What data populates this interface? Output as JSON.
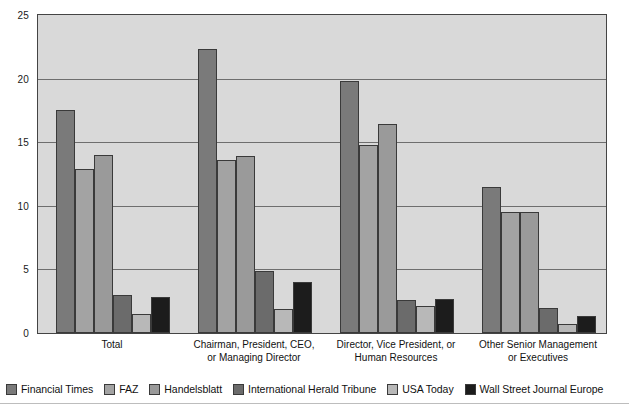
{
  "chart_data": {
    "type": "bar",
    "title": "",
    "subtitle": "",
    "xlabel": "",
    "ylabel": "",
    "ylim": [
      0,
      25
    ],
    "yticks": [
      0,
      5,
      10,
      15,
      20,
      25
    ],
    "grid": true,
    "legend_position": "bottom",
    "categories": [
      "Total",
      "Chairman, President, CEO,\nor Managing Director",
      "Director, Vice President, or\nHuman Resources",
      "Other Senior Management\nor Executives"
    ],
    "series": [
      {
        "name": "Financial Times",
        "color": "#7a7a7a",
        "values": [
          17.5,
          22.3,
          19.8,
          11.5
        ]
      },
      {
        "name": "FAZ",
        "color": "#a3a3a3",
        "values": [
          12.9,
          13.6,
          14.8,
          9.5
        ]
      },
      {
        "name": "Handelsblatt",
        "color": "#9a9a9a",
        "values": [
          14.0,
          13.9,
          16.4,
          9.5
        ]
      },
      {
        "name": "International Herald Tribune",
        "color": "#6b6b6b",
        "values": [
          3.0,
          4.9,
          2.6,
          2.0
        ]
      },
      {
        "name": "USA Today",
        "color": "#b8b8b8",
        "values": [
          1.5,
          1.9,
          2.1,
          0.7
        ]
      },
      {
        "name": "Wall Street Journal Europe",
        "color": "#1c1c1c",
        "values": [
          2.8,
          4.0,
          2.7,
          1.3
        ]
      }
    ],
    "colors": {
      "plot_background": "#d9d9d9",
      "plot_border": "#444444",
      "gridline": "#6e6e6e",
      "text": "#111111"
    }
  }
}
